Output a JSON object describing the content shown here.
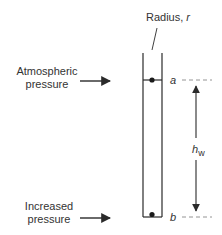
{
  "diagram": {
    "type": "capillary-tube",
    "labels": {
      "radius": "Radius, ",
      "radius_symbol": "r",
      "atmospheric_line1": "Atmospheric",
      "atmospheric_line2": "pressure",
      "increased_line1": "Increased",
      "increased_line2": "pressure",
      "point_a": "a",
      "point_b": "b",
      "height_symbol": "h",
      "height_subscript": "w"
    },
    "colors": {
      "stroke": "#2a2a2a",
      "dashed": "#888888",
      "text": "#333333"
    }
  }
}
